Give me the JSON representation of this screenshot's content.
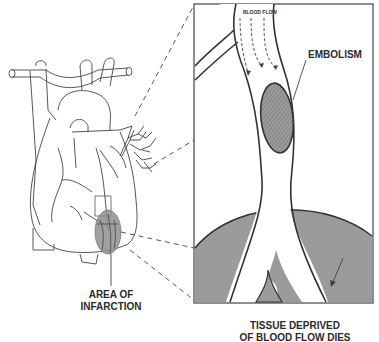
{
  "labels": {
    "blood_flow": "BLOOD FLOW",
    "embolism": "EMBOLISM",
    "area_of_infarction_line1": "AREA OF",
    "area_of_infarction_line2": "INFARCTION",
    "tissue_line1": "TISSUE DEPRIVED",
    "tissue_line2": "OF BLOOD FLOW DIES"
  },
  "colors": {
    "line": "#3a3a3a",
    "tissue_fill": "#9a9a9a",
    "embolism_fill": "#8c8c8c",
    "infarct_fill": "#8f8f8f"
  }
}
